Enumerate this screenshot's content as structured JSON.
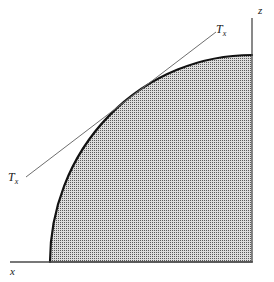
{
  "figure": {
    "title": "",
    "background_color": "#ffffff",
    "width": 274,
    "height": 282
  },
  "axes": {
    "vertical": {
      "label": "z",
      "icon": "axis-line-vertical",
      "color": "#4a4a4a",
      "x": 252,
      "y_top": 18,
      "y_bottom": 262
    },
    "horizontal": {
      "label": "x",
      "icon": "axis-line-horizontal",
      "color": "#4a4a4a",
      "y": 262,
      "x_left": 10,
      "x_right": 253
    }
  },
  "region": {
    "name": "shaded-quarter-ellipse",
    "fill_pattern": "fine-stipple-dots",
    "fill_base_color": "#d8d8d8",
    "dot_color": "#4d4d4d",
    "outline_color": "#121212",
    "outline_width": 2.2,
    "ellipse_center": {
      "x": 252,
      "y": 262
    },
    "semi_axis_x": 202,
    "semi_axis_z": 207
  },
  "tangent_line": {
    "name": "tangent-Tx",
    "color": "#6e6e6e",
    "width": 1,
    "start": {
      "x": 26,
      "y": 177
    },
    "end": {
      "x": 216,
      "y": 32
    },
    "label_upper": "T",
    "label_upper_sub": "x",
    "label_lower": "T",
    "label_lower_sub": "x"
  },
  "labels": {
    "z_axis": "z",
    "x_axis": "x",
    "tangent_upper": "T",
    "tangent_upper_sub": "x",
    "tangent_lower": "T",
    "tangent_lower_sub": "x"
  }
}
